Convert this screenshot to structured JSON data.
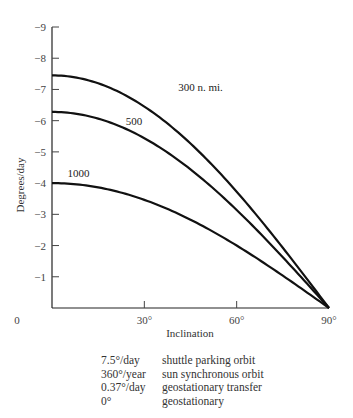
{
  "chart_data": {
    "type": "line",
    "title": "",
    "xlabel": "Inclination",
    "ylabel": "Degrees/day",
    "xlim": [
      0,
      90
    ],
    "ylim": [
      0,
      -9
    ],
    "x_ticks": [
      {
        "value": 0,
        "label": "0"
      },
      {
        "value": 30,
        "label": "30°"
      },
      {
        "value": 60,
        "label": "60°"
      },
      {
        "value": 90,
        "label": "90°"
      }
    ],
    "y_ticks": [
      {
        "value": -1,
        "label": "−1"
      },
      {
        "value": -2,
        "label": "−2"
      },
      {
        "value": -3,
        "label": "−3"
      },
      {
        "value": -4,
        "label": "−4"
      },
      {
        "value": -5,
        "label": "−5"
      },
      {
        "value": -6,
        "label": "−6"
      },
      {
        "value": -7,
        "label": "−7"
      },
      {
        "value": -8,
        "label": "−8"
      },
      {
        "value": -9,
        "label": "−9"
      }
    ],
    "grid": false,
    "series": [
      {
        "name": "300 n. mi.",
        "label": "300 n. mi.",
        "label_at": {
          "x": 41,
          "y": -6.95
        },
        "x": [
          0,
          10,
          20,
          30,
          40,
          50,
          60,
          70,
          80,
          90
        ],
        "values": [
          -7.45,
          -7.34,
          -7.0,
          -6.45,
          -5.71,
          -4.79,
          -3.73,
          -2.55,
          -1.29,
          0
        ]
      },
      {
        "name": "500",
        "label": "500",
        "label_at": {
          "x": 24,
          "y": -5.85
        },
        "x": [
          0,
          10,
          20,
          30,
          40,
          50,
          60,
          70,
          80,
          90
        ],
        "values": [
          -6.28,
          -6.18,
          -5.9,
          -5.44,
          -4.81,
          -4.04,
          -3.14,
          -2.15,
          -1.09,
          0
        ]
      },
      {
        "name": "1000",
        "label": "1000",
        "label_at": {
          "x": 5,
          "y": -4.2
        },
        "x": [
          0,
          10,
          20,
          30,
          40,
          50,
          60,
          70,
          80,
          90
        ],
        "values": [
          -4.0,
          -3.94,
          -3.76,
          -3.46,
          -3.06,
          -2.57,
          -2.0,
          -1.37,
          -0.69,
          0
        ]
      }
    ]
  },
  "legend_table": [
    {
      "value": "7.5°/day",
      "description": "shuttle parking orbit"
    },
    {
      "value": "360°/year",
      "description": "sun synchronous orbit"
    },
    {
      "value": "0.37°/day",
      "description": "geostationary transfer"
    },
    {
      "value": "0°",
      "description": "geostationary"
    }
  ]
}
